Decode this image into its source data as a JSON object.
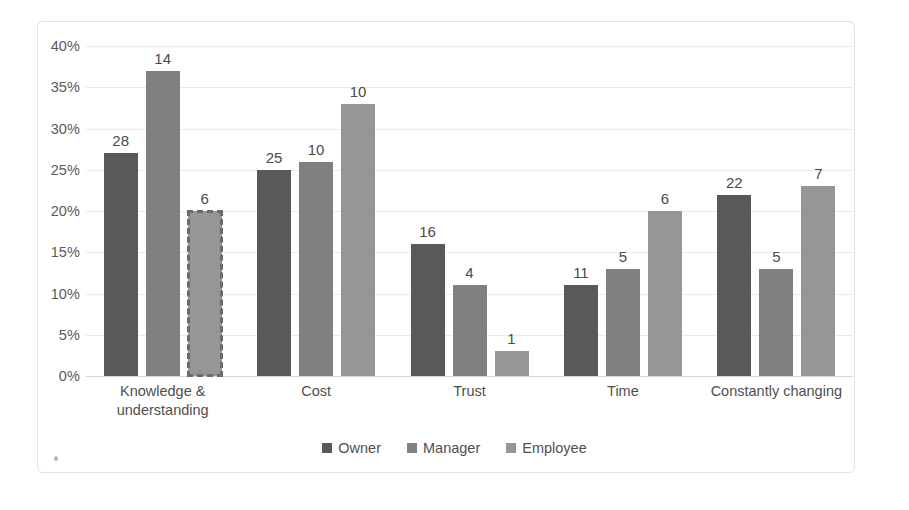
{
  "chart_data": {
    "type": "bar",
    "title": "",
    "subtitle": "",
    "xlabel": "",
    "ylabel": "",
    "categories": [
      "Knowledge &\nunderstanding",
      "Cost",
      "Trust",
      "Time",
      "Constantly changing"
    ],
    "series": [
      {
        "name": "Owner",
        "color": "#595959",
        "values": [
          27,
          25,
          16,
          11,
          22
        ],
        "data_labels": [
          "28",
          "25",
          "16",
          "11",
          "22"
        ]
      },
      {
        "name": "Manager",
        "color": "#808080",
        "values": [
          37,
          26,
          11,
          13,
          13
        ],
        "data_labels": [
          "14",
          "10",
          "4",
          "5",
          "5"
        ]
      },
      {
        "name": "Employee",
        "color": "#969696",
        "values": [
          20,
          33,
          3,
          20,
          23
        ],
        "data_labels": [
          "6",
          "10",
          "1",
          "6",
          "7"
        ]
      }
    ],
    "selected_point": {
      "series": "Employee",
      "category": "Knowledge & understanding"
    },
    "ylim": [
      0,
      40
    ],
    "ytick_step": 5,
    "yticks": [
      "40%",
      "35%",
      "30%",
      "25%",
      "20%",
      "15%",
      "10%",
      "5%",
      "0%"
    ],
    "ytick_values": [
      40,
      35,
      30,
      25,
      20,
      15,
      10,
      5,
      0
    ],
    "grid": true,
    "legend_position": "bottom",
    "axis_value_suffix": "%"
  },
  "axis": {
    "y_ticks": [
      {
        "label": "40%",
        "value": 40
      },
      {
        "label": "35%",
        "value": 35
      },
      {
        "label": "30%",
        "value": 30
      },
      {
        "label": "25%",
        "value": 25
      },
      {
        "label": "20%",
        "value": 20
      },
      {
        "label": "15%",
        "value": 15
      },
      {
        "label": "10%",
        "value": 10
      },
      {
        "label": "5%",
        "value": 5
      },
      {
        "label": "0%",
        "value": 0
      }
    ],
    "x_categories": [
      {
        "line1": "Knowledge &",
        "line2": "understanding"
      },
      {
        "line1": "Cost",
        "line2": ""
      },
      {
        "line1": "Trust",
        "line2": ""
      },
      {
        "line1": "Time",
        "line2": ""
      },
      {
        "line1": "Constantly changing",
        "line2": ""
      }
    ]
  },
  "legend": {
    "items": [
      {
        "label": "Owner",
        "color": "#595959"
      },
      {
        "label": "Manager",
        "color": "#808080"
      },
      {
        "label": "Employee",
        "color": "#969696"
      }
    ]
  },
  "colors": {
    "owner": "#595959",
    "manager": "#808080",
    "employee": "#969696",
    "gridline": "#e8eaec",
    "frame": "#e2e2e2",
    "text": "#4f4f4f",
    "background": "#ffffff"
  }
}
